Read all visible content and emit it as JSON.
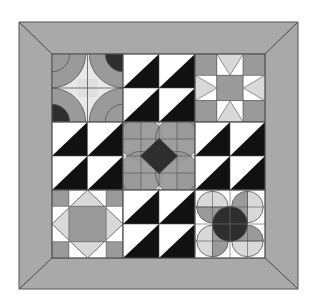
{
  "quilt": {
    "title": "Sampler quilt with mitered border",
    "colors": {
      "background": "#ffffff",
      "border": "#a9a9a9",
      "line": "#555555",
      "black": "#111111",
      "dark": "#2e2e2e",
      "mid_gray": "#9a9a9a",
      "light_gray": "#d9d9d9",
      "white": "#ffffff"
    },
    "outer": {
      "x1": 19,
      "y1": 22,
      "x2": 298,
      "y2": 289
    },
    "inner": {
      "x1": 52,
      "y1": 54,
      "x2": 265,
      "y2": 258
    },
    "grid": {
      "cols": [
        52,
        123,
        195,
        265
      ],
      "rows": [
        54,
        122,
        190,
        258
      ]
    },
    "blocks": [
      {
        "row": 0,
        "col": 0,
        "type": "orange-peel-flower"
      },
      {
        "row": 0,
        "col": 1,
        "type": "half-square-triangles"
      },
      {
        "row": 0,
        "col": 2,
        "type": "sawtooth-star"
      },
      {
        "row": 1,
        "col": 0,
        "type": "half-square-triangles"
      },
      {
        "row": 1,
        "col": 1,
        "type": "flower-diamond-center"
      },
      {
        "row": 1,
        "col": 2,
        "type": "half-square-triangles"
      },
      {
        "row": 2,
        "col": 0,
        "type": "square-in-square"
      },
      {
        "row": 2,
        "col": 1,
        "type": "half-square-triangles"
      },
      {
        "row": 2,
        "col": 2,
        "type": "pinwheel-circles"
      }
    ]
  }
}
